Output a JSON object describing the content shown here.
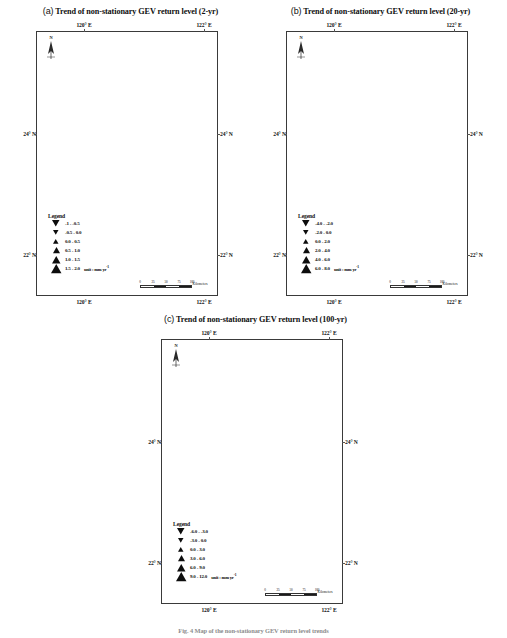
{
  "figure": {
    "caption": "Fig. 4 Map of the non-stationary GEV return level trends"
  },
  "panels": [
    {
      "tag": "(a)",
      "title": "Trend of non-stationary GEV return level (2-yr)",
      "axis": {
        "top_left": "120° E",
        "top_right": "122° E",
        "bottom_left": "120° E",
        "bottom_right": "122° E",
        "left_top": "24° N",
        "left_bottom": "22° N",
        "right_top": "24° N",
        "right_bottom": "22° N"
      },
      "compass": {
        "label": "N"
      },
      "legend": {
        "title": "Legend",
        "unit": "unit : mm yr",
        "unit_exp": "-1",
        "entries": [
          {
            "symbol": "down-triangle",
            "size": 7.5,
            "label": "-1 - -0.5"
          },
          {
            "symbol": "down-triangle",
            "size": 5.5,
            "label": "-0.5 - 0.0"
          },
          {
            "symbol": "up-triangle",
            "size": 5.5,
            "label": "0.0 - 0.5"
          },
          {
            "symbol": "up-triangle",
            "size": 7.0,
            "label": "0.5 - 1.0"
          },
          {
            "symbol": "up-triangle",
            "size": 8.5,
            "label": "1.0 - 1.5"
          },
          {
            "symbol": "up-triangle",
            "size": 10.5,
            "label": "1.5 - 2.0"
          }
        ]
      },
      "scalebar": {
        "ticks": [
          "0",
          "25",
          "50",
          "75",
          "100"
        ],
        "unit": "Kilometers"
      }
    },
    {
      "tag": "(b)",
      "title": "Trend of non-stationary GEV return level (20-yr)",
      "axis": {
        "top_left": "120° E",
        "top_right": "122° E",
        "bottom_left": "120° E",
        "bottom_right": "122° E",
        "left_top": "24° N",
        "left_bottom": "22° N",
        "right_top": "24° N",
        "right_bottom": "22° N"
      },
      "compass": {
        "label": "N"
      },
      "legend": {
        "title": "Legend",
        "unit": "unit : mm yr",
        "unit_exp": "-1",
        "entries": [
          {
            "symbol": "down-triangle",
            "size": 7.5,
            "label": "-4.0 - -2.0"
          },
          {
            "symbol": "down-triangle",
            "size": 5.5,
            "label": "-2.0 - 0.0"
          },
          {
            "symbol": "up-triangle",
            "size": 5.5,
            "label": "0.0 - 2.0"
          },
          {
            "symbol": "up-triangle",
            "size": 7.0,
            "label": "2.0 - 4.0"
          },
          {
            "symbol": "up-triangle",
            "size": 8.5,
            "label": "4.0 - 6.0"
          },
          {
            "symbol": "up-triangle",
            "size": 10.5,
            "label": "6.0 - 8.0"
          }
        ]
      },
      "scalebar": {
        "ticks": [
          "0",
          "25",
          "50",
          "75",
          "100"
        ],
        "unit": "Kilometers"
      }
    },
    {
      "tag": "(c)",
      "title": "Trend of non-stationary GEV return level (100-yr)",
      "axis": {
        "top_left": "120° E",
        "top_right": "122° E",
        "bottom_left": "120° E",
        "bottom_right": "122° E",
        "left_top": "24° N",
        "left_bottom": "22° N",
        "right_top": "24° N",
        "right_bottom": "22° N"
      },
      "compass": {
        "label": "N"
      },
      "legend": {
        "title": "Legend",
        "unit": "unit : mm yr",
        "unit_exp": "-1",
        "entries": [
          {
            "symbol": "down-triangle",
            "size": 7.5,
            "label": "-6.0 - -3.0"
          },
          {
            "symbol": "down-triangle",
            "size": 5.5,
            "label": "-3.0 - 0.0"
          },
          {
            "symbol": "up-triangle",
            "size": 5.5,
            "label": "0.0 - 3.0"
          },
          {
            "symbol": "up-triangle",
            "size": 7.0,
            "label": "3.0 - 6.0"
          },
          {
            "symbol": "up-triangle",
            "size": 8.5,
            "label": "6.0 - 9.0"
          },
          {
            "symbol": "up-triangle",
            "size": 10.5,
            "label": "9.0 - 12.0"
          }
        ]
      },
      "scalebar": {
        "ticks": [
          "0",
          "25",
          "50",
          "75",
          "100"
        ],
        "unit": "Kilometers"
      }
    }
  ],
  "chart_data": {
    "type": "scatter",
    "title": "Trend of non-stationary GEV return level",
    "xlabel": "Longitude",
    "ylabel": "Latitude",
    "xlim": [
      119.4,
      122.4
    ],
    "ylim": [
      21.6,
      25.5
    ],
    "grid": false,
    "legend_position": "inside-bottom-left",
    "units": "mm yr^-1",
    "marker_encoding": "upward triangle = positive trend, downward triangle = negative trend; marker size scales with magnitude",
    "subplots": [
      {
        "tag": "(a)",
        "return_period_years": 2,
        "bins": [
          "-1 - -0.5",
          "-0.5 - 0.0",
          "0.0 - 0.5",
          "0.5 - 1.0",
          "1.0 - 1.5",
          "1.5 - 2.0"
        ],
        "points": [
          {
            "x": 121.52,
            "y": 25.17,
            "class": "-0.5 - 0.0",
            "dir": "down",
            "mag": 2
          },
          {
            "x": 121.74,
            "y": 25.13,
            "class": "0.5 - 1.0",
            "dir": "up",
            "mag": 3
          },
          {
            "x": 122.08,
            "y": 25.2,
            "class": "0.5 - 1.0",
            "dir": "up",
            "mag": 3
          },
          {
            "x": 121.51,
            "y": 24.95,
            "class": "0.5 - 1.0",
            "dir": "up",
            "mag": 3
          },
          {
            "x": 121.73,
            "y": 24.92,
            "class": "-0.5 - 0.0",
            "dir": "down",
            "mag": 2
          },
          {
            "x": 121.56,
            "y": 24.83,
            "class": "0.5 - 1.0",
            "dir": "up",
            "mag": 3
          },
          {
            "x": 121.76,
            "y": 24.68,
            "class": "0.5 - 1.0",
            "dir": "up",
            "mag": 3
          },
          {
            "x": 121.0,
            "y": 23.97,
            "class": "0.5 - 1.0",
            "dir": "up",
            "mag": 3
          },
          {
            "x": 121.62,
            "y": 23.98,
            "class": "1.5 - 2.0",
            "dir": "up",
            "mag": 5
          },
          {
            "x": 121.15,
            "y": 23.6,
            "class": "1.0 - 1.5",
            "dir": "up",
            "mag": 4
          },
          {
            "x": 121.18,
            "y": 23.13,
            "class": "1.0 - 1.5",
            "dir": "up",
            "mag": 4
          },
          {
            "x": 121.32,
            "y": 23.11,
            "class": "1.5 - 2.0",
            "dir": "up",
            "mag": 5
          },
          {
            "x": 120.3,
            "y": 23.05,
            "class": "0.5 - 1.0",
            "dir": "up",
            "mag": 3
          },
          {
            "x": 120.48,
            "y": 22.48,
            "class": "1.0 - 1.5",
            "dir": "up",
            "mag": 4
          },
          {
            "x": 121.12,
            "y": 22.42,
            "class": "0.5 - 1.0",
            "dir": "up",
            "mag": 3
          },
          {
            "x": 121.15,
            "y": 22.75,
            "class": "0.5 - 1.0",
            "dir": "up",
            "mag": 3
          },
          {
            "x": 121.37,
            "y": 22.98,
            "class": "-0.5 - 0.0",
            "dir": "down",
            "mag": 2
          },
          {
            "x": 120.88,
            "y": 22.02,
            "class": "1.5 - 2.0",
            "dir": "up",
            "mag": 5
          },
          {
            "x": 121.55,
            "y": 22.05,
            "class": "1.0 - 1.5",
            "dir": "up",
            "mag": 4
          }
        ]
      },
      {
        "tag": "(b)",
        "return_period_years": 20,
        "bins": [
          "-4.0 - -2.0",
          "-2.0 - 0.0",
          "0.0 - 2.0",
          "2.0 - 4.0",
          "4.0 - 6.0",
          "6.0 - 8.0"
        ],
        "points": [
          {
            "x": 121.52,
            "y": 25.17,
            "class": "-2.0 - 0.0",
            "dir": "down",
            "mag": 2
          },
          {
            "x": 121.74,
            "y": 25.13,
            "class": "2.0 - 4.0",
            "dir": "up",
            "mag": 3
          },
          {
            "x": 122.08,
            "y": 25.2,
            "class": "2.0 - 4.0",
            "dir": "up",
            "mag": 3
          },
          {
            "x": 121.51,
            "y": 24.95,
            "class": "2.0 - 4.0",
            "dir": "up",
            "mag": 3
          },
          {
            "x": 121.73,
            "y": 24.92,
            "class": "0.0 - 2.0",
            "dir": "up",
            "mag": 2
          },
          {
            "x": 121.56,
            "y": 24.83,
            "class": "2.0 - 4.0",
            "dir": "up",
            "mag": 3
          },
          {
            "x": 121.76,
            "y": 24.68,
            "class": "2.0 - 4.0",
            "dir": "up",
            "mag": 3
          },
          {
            "x": 121.0,
            "y": 23.97,
            "class": "4.0 - 6.0",
            "dir": "up",
            "mag": 4
          },
          {
            "x": 121.62,
            "y": 23.98,
            "class": "6.0 - 8.0",
            "dir": "up",
            "mag": 5
          },
          {
            "x": 121.15,
            "y": 23.6,
            "class": "4.0 - 6.0",
            "dir": "up",
            "mag": 4
          },
          {
            "x": 121.18,
            "y": 23.13,
            "class": "6.0 - 8.0",
            "dir": "up",
            "mag": 5
          },
          {
            "x": 121.32,
            "y": 23.11,
            "class": "6.0 - 8.0",
            "dir": "up",
            "mag": 5
          },
          {
            "x": 120.3,
            "y": 23.05,
            "class": "2.0 - 4.0",
            "dir": "up",
            "mag": 3
          },
          {
            "x": 120.48,
            "y": 22.48,
            "class": "4.0 - 6.0",
            "dir": "up",
            "mag": 4
          },
          {
            "x": 121.12,
            "y": 22.42,
            "class": "2.0 - 4.0",
            "dir": "up",
            "mag": 3
          },
          {
            "x": 121.15,
            "y": 22.75,
            "class": "2.0 - 4.0",
            "dir": "up",
            "mag": 3
          },
          {
            "x": 121.37,
            "y": 22.98,
            "class": "-2.0 - 0.0",
            "dir": "down",
            "mag": 2
          },
          {
            "x": 120.88,
            "y": 22.02,
            "class": "6.0 - 8.0",
            "dir": "up",
            "mag": 5
          },
          {
            "x": 121.55,
            "y": 22.05,
            "class": "2.0 - 4.0",
            "dir": "up",
            "mag": 3
          }
        ]
      },
      {
        "tag": "(c)",
        "return_period_years": 100,
        "bins": [
          "-6.0 - -3.0",
          "-3.0 - 0.0",
          "0.0 - 3.0",
          "3.0 - 6.0",
          "6.0 - 9.0",
          "9.0 - 12.0"
        ],
        "points": [
          {
            "x": 121.52,
            "y": 25.17,
            "class": "-3.0 - 0.0",
            "dir": "down",
            "mag": 2
          },
          {
            "x": 121.74,
            "y": 25.13,
            "class": "3.0 - 6.0",
            "dir": "up",
            "mag": 3
          },
          {
            "x": 122.08,
            "y": 25.2,
            "class": "3.0 - 6.0",
            "dir": "up",
            "mag": 3
          },
          {
            "x": 121.51,
            "y": 24.95,
            "class": "3.0 - 6.0",
            "dir": "up",
            "mag": 3
          },
          {
            "x": 121.73,
            "y": 24.92,
            "class": "3.0 - 6.0",
            "dir": "up",
            "mag": 3
          },
          {
            "x": 121.56,
            "y": 24.83,
            "class": "0.0 - 3.0",
            "dir": "up",
            "mag": 2
          },
          {
            "x": 121.76,
            "y": 24.68,
            "class": "3.0 - 6.0",
            "dir": "up",
            "mag": 3
          },
          {
            "x": 121.0,
            "y": 23.97,
            "class": "6.0 - 9.0",
            "dir": "up",
            "mag": 4
          },
          {
            "x": 121.62,
            "y": 23.98,
            "class": "3.0 - 6.0",
            "dir": "up",
            "mag": 3
          },
          {
            "x": 121.15,
            "y": 23.6,
            "class": "6.0 - 9.0",
            "dir": "up",
            "mag": 4
          },
          {
            "x": 121.18,
            "y": 23.13,
            "class": "9.0 - 12.0",
            "dir": "up",
            "mag": 5
          },
          {
            "x": 121.32,
            "y": 23.11,
            "class": "9.0 - 12.0",
            "dir": "up",
            "mag": 5
          },
          {
            "x": 120.3,
            "y": 23.05,
            "class": "3.0 - 6.0",
            "dir": "up",
            "mag": 3
          },
          {
            "x": 120.48,
            "y": 22.48,
            "class": "6.0 - 9.0",
            "dir": "up",
            "mag": 4
          },
          {
            "x": 121.12,
            "y": 22.42,
            "class": "3.0 - 6.0",
            "dir": "up",
            "mag": 3
          },
          {
            "x": 121.15,
            "y": 22.75,
            "class": "3.0 - 6.0",
            "dir": "up",
            "mag": 3
          },
          {
            "x": 121.37,
            "y": 22.98,
            "class": "-3.0 - 0.0",
            "dir": "down",
            "mag": 2
          },
          {
            "x": 120.88,
            "y": 22.02,
            "class": "9.0 - 12.0",
            "dir": "up",
            "mag": 5
          },
          {
            "x": 121.55,
            "y": 22.05,
            "class": "6.0 - 9.0",
            "dir": "up",
            "mag": 4
          }
        ]
      }
    ]
  }
}
